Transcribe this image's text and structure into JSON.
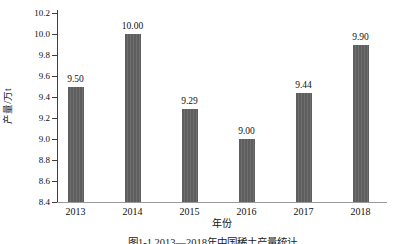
{
  "figure": {
    "caption": "图1-1 2013—2018年中国稀土产量统计"
  },
  "chart_data": {
    "type": "bar",
    "title": "",
    "xlabel": "年份",
    "ylabel": "产量/万t",
    "categories": [
      "2013",
      "2014",
      "2015",
      "2016",
      "2017",
      "2018"
    ],
    "values": [
      9.5,
      10.0,
      9.29,
      9.0,
      9.44,
      9.9
    ],
    "value_labels": [
      "9.50",
      "10.00",
      "9.29",
      "9.00",
      "9.44",
      "9.90"
    ],
    "ylim": [
      8.4,
      10.2
    ],
    "ytick_step": 0.2,
    "yticks": [
      "8.4",
      "8.6",
      "8.8",
      "9.0",
      "9.2",
      "9.4",
      "9.6",
      "9.8",
      "10.0",
      "10.2"
    ],
    "grid": false,
    "legend": "none",
    "bar_color": "#5e5e5e",
    "bar_stripe_color": "#6f6f6f",
    "axis_color": "#3f3f3f",
    "baseline_color": "#9a9a9a"
  }
}
